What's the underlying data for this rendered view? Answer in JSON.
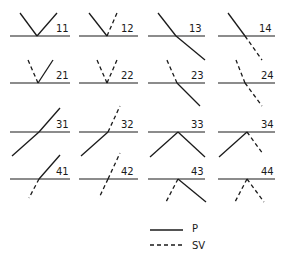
{
  "diagram": {
    "panels": [
      {
        "id": "11",
        "label": "11",
        "interface": [
          10,
          70,
          36
        ],
        "apex": [
          37,
          36
        ],
        "rays": [
          {
            "to": [
              20,
              13
            ],
            "style": "P"
          },
          {
            "to": [
              57,
              13
            ],
            "style": "P"
          }
        ],
        "label_pos": [
          56,
          32
        ]
      },
      {
        "id": "12",
        "label": "12",
        "interface": [
          79,
          138,
          36
        ],
        "apex": [
          107,
          36
        ],
        "rays": [
          {
            "to": [
              89,
              13
            ],
            "style": "P"
          },
          {
            "to": [
              117,
              13
            ],
            "style": "SV"
          }
        ],
        "label_pos": [
          121,
          32
        ]
      },
      {
        "id": "13",
        "label": "13",
        "interface": [
          148,
          205,
          36
        ],
        "apex": [
          176,
          36
        ],
        "rays": [
          {
            "to": [
              158,
              13
            ],
            "style": "P"
          },
          {
            "to": [
              205,
              60
            ],
            "style": "P"
          }
        ],
        "label_pos": [
          189,
          32
        ]
      },
      {
        "id": "14",
        "label": "14",
        "interface": [
          218,
          275,
          36
        ],
        "apex": [
          245,
          36
        ],
        "rays": [
          {
            "to": [
              228,
              13
            ],
            "style": "P"
          },
          {
            "to": [
              262,
              60
            ],
            "style": "SV"
          }
        ],
        "label_pos": [
          259,
          32
        ]
      },
      {
        "id": "21",
        "label": "21",
        "interface": [
          10,
          70,
          83
        ],
        "apex": [
          38,
          83
        ],
        "rays": [
          {
            "to": [
              28,
              60
            ],
            "style": "SV"
          },
          {
            "to": [
              53,
              60
            ],
            "style": "P"
          }
        ],
        "label_pos": [
          56,
          79
        ]
      },
      {
        "id": "22",
        "label": "22",
        "interface": [
          79,
          138,
          83
        ],
        "apex": [
          107,
          83
        ],
        "rays": [
          {
            "to": [
              97,
              60
            ],
            "style": "SV"
          },
          {
            "to": [
              117,
              60
            ],
            "style": "SV"
          }
        ],
        "label_pos": [
          121,
          79
        ]
      },
      {
        "id": "23",
        "label": "23",
        "interface": [
          148,
          205,
          83
        ],
        "apex": [
          177,
          83
        ],
        "rays": [
          {
            "to": [
              166,
              58
            ],
            "style": "SV"
          },
          {
            "to": [
              200,
              106
            ],
            "style": "P"
          }
        ],
        "label_pos": [
          191,
          79
        ]
      },
      {
        "id": "24",
        "label": "24",
        "interface": [
          218,
          275,
          83
        ],
        "apex": [
          245,
          83
        ],
        "rays": [
          {
            "to": [
              236,
              60
            ],
            "style": "SV"
          },
          {
            "to": [
              262,
              106
            ],
            "style": "SV"
          }
        ],
        "label_pos": [
          261,
          79
        ]
      },
      {
        "id": "31",
        "label": "31",
        "interface": [
          10,
          70,
          132
        ],
        "apex": [
          39,
          132
        ],
        "rays": [
          {
            "to": [
              12,
              156
            ],
            "style": "P"
          },
          {
            "to": [
              60,
              108
            ],
            "style": "P"
          }
        ],
        "label_pos": [
          56,
          128
        ]
      },
      {
        "id": "32",
        "label": "32",
        "interface": [
          79,
          138,
          132
        ],
        "apex": [
          108,
          132
        ],
        "rays": [
          {
            "to": [
              81,
              156
            ],
            "style": "P"
          },
          {
            "to": [
              120,
              106
            ],
            "style": "SV"
          }
        ],
        "label_pos": [
          121,
          128
        ]
      },
      {
        "id": "33",
        "label": "33",
        "interface": [
          148,
          205,
          132
        ],
        "apex": [
          178,
          132
        ],
        "rays": [
          {
            "to": [
              150,
              157
            ],
            "style": "P"
          },
          {
            "to": [
              205,
              157
            ],
            "style": "P"
          }
        ],
        "label_pos": [
          191,
          128
        ]
      },
      {
        "id": "34",
        "label": "34",
        "interface": [
          218,
          275,
          132
        ],
        "apex": [
          247,
          132
        ],
        "rays": [
          {
            "to": [
              219,
              157
            ],
            "style": "P"
          },
          {
            "to": [
              263,
              154
            ],
            "style": "SV"
          }
        ],
        "label_pos": [
          261,
          128
        ]
      },
      {
        "id": "41",
        "label": "41",
        "interface": [
          10,
          70,
          179
        ],
        "apex": [
          39,
          179
        ],
        "rays": [
          {
            "to": [
              29,
              198
            ],
            "style": "SV"
          },
          {
            "to": [
              60,
              155
            ],
            "style": "P"
          }
        ],
        "label_pos": [
          56,
          175
        ]
      },
      {
        "id": "42",
        "label": "42",
        "interface": [
          79,
          138,
          179
        ],
        "apex": [
          108,
          179
        ],
        "rays": [
          {
            "to": [
              99,
              198
            ],
            "style": "SV"
          },
          {
            "to": [
              120,
              153
            ],
            "style": "SV"
          }
        ],
        "label_pos": [
          121,
          175
        ]
      },
      {
        "id": "43",
        "label": "43",
        "interface": [
          148,
          205,
          179
        ],
        "apex": [
          178,
          179
        ],
        "rays": [
          {
            "to": [
              166,
              202
            ],
            "style": "SV"
          },
          {
            "to": [
              206,
              202
            ],
            "style": "P"
          }
        ],
        "label_pos": [
          191,
          175
        ]
      },
      {
        "id": "44",
        "label": "44",
        "interface": [
          218,
          275,
          179
        ],
        "apex": [
          247,
          179
        ],
        "rays": [
          {
            "to": [
              235,
              202
            ],
            "style": "SV"
          },
          {
            "to": [
              264,
              202
            ],
            "style": "SV"
          }
        ],
        "label_pos": [
          261,
          175
        ]
      }
    ]
  },
  "legend": {
    "items": [
      {
        "style": "P",
        "label": "P",
        "line": [
          150,
          183,
          230
        ],
        "label_pos": [
          192,
          232
        ]
      },
      {
        "style": "SV",
        "label": "SV",
        "line": [
          150,
          183,
          245
        ],
        "label_pos": [
          192,
          249
        ]
      }
    ]
  }
}
